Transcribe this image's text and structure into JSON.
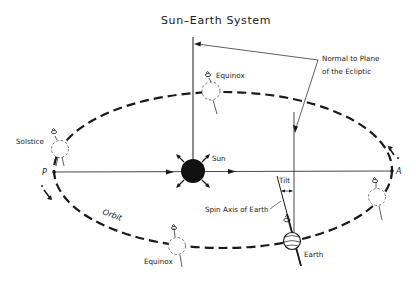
{
  "title": "Sun–Earth System",
  "labels": {
    "normal_line1": "Normal to Plane",
    "normal_line2": "of the Ecliptic",
    "equinox_top": "Equinox",
    "equinox_bottom": "Equinox",
    "solstice_left": "Solstice",
    "sun": "Sun",
    "tilt": "Tilt",
    "spin_axis": "Spin Axis of Earth",
    "earth": "Earth",
    "orbit": "Orbit",
    "perihelion": "P",
    "aphelion": "A"
  },
  "colors": {
    "ink": "#1a1a1a",
    "background": "#ffffff"
  },
  "icons": {
    "sun": "filled-circle-with-rays",
    "earth": "striped-globe",
    "earth_positions": "dashed-circle",
    "rotation": "curled-arrow-icon",
    "orbit_direction": "dashed-arrow-icon"
  }
}
